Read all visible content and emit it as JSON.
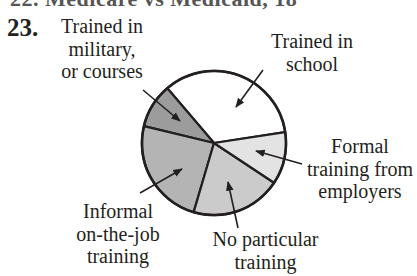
{
  "header": {
    "cutoff_text": "22. Medicare vs Medicaid, 18",
    "question_number": "23."
  },
  "chart_data": {
    "type": "pie",
    "title": "",
    "slices": [
      {
        "label": "Trained in school",
        "label_lines": [
          "Trained in",
          "school"
        ],
        "value": 34,
        "color": "#ffffff",
        "start_deg": 8.7,
        "end_deg": 130.4
      },
      {
        "label": "Trained in military, or courses",
        "label_lines": [
          "Trained in",
          "military,",
          "or courses"
        ],
        "value": 10,
        "color": "#9c9c9c",
        "start_deg": 130.4,
        "end_deg": 166.5
      },
      {
        "label": "Informal on-the-job training",
        "label_lines": [
          "Informal",
          "on-the-job",
          "training"
        ],
        "value": 24,
        "color": "#b4b4b4",
        "start_deg": 166.5,
        "end_deg": 253.6
      },
      {
        "label": "No particular training",
        "label_lines": [
          "No particular",
          "training"
        ],
        "value": 20,
        "color": "#cbcbcb",
        "start_deg": 253.6,
        "end_deg": 326.5
      },
      {
        "label": "Formal training from employers",
        "label_lines": [
          "Formal",
          "training from",
          "employers"
        ],
        "value": 12,
        "color": "#e3e3e3",
        "start_deg": 326.5,
        "end_deg": 368.7
      }
    ],
    "legend": "none (callout labels with leader arrows)",
    "units": "approximate share of total (%)"
  }
}
